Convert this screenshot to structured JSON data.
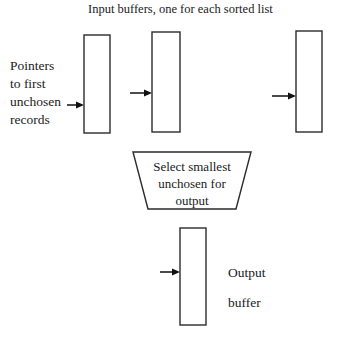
{
  "diagram": {
    "title": "Input buffers, one for each sorted list",
    "pointers_label_lines": "Pointers\nto first\nunchosen\nrecords",
    "selector_text_lines": "Select smallest\nunchosen for\noutput",
    "output_label_lines": "Output\nbuffer",
    "colors": {
      "background": "#ffffff",
      "stroke": "#2b2b2b",
      "arrow": "#111111",
      "text": "#1a1a1a"
    },
    "input_buffers": [
      {
        "name": "input-buffer-1",
        "x": 84,
        "y": 35,
        "width": 26,
        "height": 98
      },
      {
        "name": "input-buffer-2",
        "x": 152,
        "y": 32,
        "width": 28,
        "height": 100
      },
      {
        "name": "input-buffer-3",
        "x": 296,
        "y": 31,
        "width": 26,
        "height": 101
      }
    ],
    "pointer_arrows": [
      {
        "name": "pointer-arrow-1",
        "from_x": 67,
        "to_x": 84,
        "y": 105
      },
      {
        "name": "pointer-arrow-2",
        "from_x": 130,
        "to_x": 152,
        "y": 93
      },
      {
        "name": "pointer-arrow-3",
        "from_x": 272,
        "to_x": 296,
        "y": 96
      }
    ],
    "selector": {
      "name": "selector-trapezoid",
      "top_left_x": 133,
      "top_right_x": 251,
      "bottom_left_x": 148,
      "bottom_right_x": 236,
      "top_y": 152,
      "bottom_y": 209
    },
    "output_buffer": {
      "name": "output-buffer",
      "x": 180,
      "y": 228,
      "width": 26,
      "height": 97
    },
    "output_arrow": {
      "name": "output-arrow",
      "from_x": 160,
      "to_x": 180,
      "y": 272
    }
  }
}
